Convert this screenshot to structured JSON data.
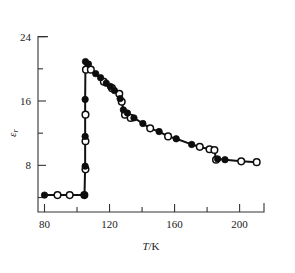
{
  "chart_data": {
    "type": "scatter",
    "title": "",
    "xlabel": "T/K",
    "ylabel": "εr",
    "ylabel_parts": {
      "symbol": "ε",
      "subscript": "r"
    },
    "xlim": [
      76,
      215
    ],
    "ylim": [
      2.2,
      25.2
    ],
    "grid": false,
    "legend": "none",
    "x_ticks_major": [
      80,
      120,
      160,
      200
    ],
    "x_tick_labels": [
      "80",
      "120",
      "160",
      "200"
    ],
    "x_ticks_minor": [
      100,
      140,
      180
    ],
    "y_ticks_major": [
      8,
      16,
      24
    ],
    "y_tick_labels": [
      "8",
      "16",
      "24"
    ],
    "y_ticks_minor": [
      4,
      12,
      20
    ],
    "series": [
      {
        "name": "filled-circles",
        "marker": "filled circle",
        "color": "#0d0d0d",
        "points": [
          [
            80.0,
            4.3
          ],
          [
            104.6,
            4.3
          ],
          [
            105.0,
            7.9
          ],
          [
            105.0,
            11.6
          ],
          [
            105.0,
            16.2
          ],
          [
            105.2,
            20.9
          ],
          [
            107.0,
            20.6
          ],
          [
            111.5,
            19.4
          ],
          [
            114.5,
            18.9
          ],
          [
            118.0,
            18.2
          ],
          [
            120.5,
            17.8
          ],
          [
            123.0,
            17.3
          ],
          [
            126.5,
            16.3
          ],
          [
            128.5,
            14.9
          ],
          [
            131.0,
            14.5
          ],
          [
            135.0,
            13.9
          ],
          [
            140.5,
            13.2
          ],
          [
            150.5,
            12.2
          ],
          [
            161.0,
            11.3
          ],
          [
            170.5,
            10.6
          ],
          [
            186.5,
            8.8
          ],
          [
            191.0,
            8.7
          ]
        ]
      },
      {
        "name": "open-circles",
        "marker": "open circle",
        "color": "#ffffff",
        "points": [
          [
            88.0,
            4.3
          ],
          [
            95.5,
            4.3
          ],
          [
            104.5,
            4.3
          ],
          [
            105.2,
            7.5
          ],
          [
            105.2,
            11.0
          ],
          [
            105.2,
            14.3
          ],
          [
            105.5,
            19.9
          ],
          [
            108.5,
            19.9
          ],
          [
            116.5,
            18.4
          ],
          [
            121.5,
            17.6
          ],
          [
            126.0,
            16.9
          ],
          [
            127.5,
            15.9
          ],
          [
            129.5,
            14.3
          ],
          [
            133.0,
            13.9
          ],
          [
            145.0,
            12.6
          ],
          [
            156.0,
            11.6
          ],
          [
            175.5,
            10.3
          ],
          [
            181.5,
            10.0
          ],
          [
            184.5,
            9.9
          ],
          [
            185.5,
            8.7
          ],
          [
            201.0,
            8.5
          ],
          [
            210.5,
            8.4
          ]
        ]
      }
    ],
    "connector_path": [
      [
        80.0,
        4.3
      ],
      [
        88.0,
        4.3
      ],
      [
        95.5,
        4.3
      ],
      [
        104.6,
        4.3
      ],
      [
        105.0,
        7.9
      ],
      [
        105.0,
        11.6
      ],
      [
        105.0,
        16.2
      ],
      [
        105.2,
        20.9
      ],
      [
        108.5,
        19.9
      ],
      [
        111.5,
        19.4
      ],
      [
        114.5,
        18.9
      ],
      [
        116.5,
        18.4
      ],
      [
        118.0,
        18.2
      ],
      [
        120.5,
        17.8
      ],
      [
        121.5,
        17.6
      ],
      [
        123.0,
        17.3
      ],
      [
        126.0,
        16.9
      ],
      [
        126.5,
        16.3
      ],
      [
        127.5,
        15.9
      ],
      [
        128.5,
        14.9
      ],
      [
        129.5,
        14.3
      ],
      [
        131.0,
        14.5
      ],
      [
        133.0,
        13.9
      ],
      [
        135.0,
        13.9
      ],
      [
        140.5,
        13.2
      ],
      [
        145.0,
        12.6
      ],
      [
        150.5,
        12.2
      ],
      [
        156.0,
        11.6
      ],
      [
        161.0,
        11.3
      ],
      [
        170.5,
        10.6
      ],
      [
        175.5,
        10.3
      ],
      [
        181.5,
        10.0
      ],
      [
        184.5,
        9.9
      ],
      [
        185.5,
        8.7
      ],
      [
        186.5,
        8.8
      ],
      [
        191.0,
        8.7
      ],
      [
        201.0,
        8.5
      ],
      [
        210.5,
        8.4
      ]
    ]
  }
}
